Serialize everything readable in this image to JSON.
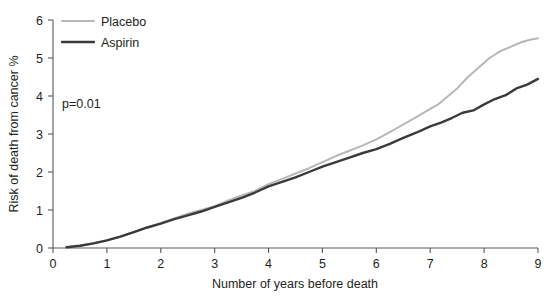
{
  "chart_data": {
    "type": "line",
    "title": "",
    "xlabel": "Number of years before death",
    "ylabel": "Risk of death from cancer %",
    "xlim": [
      0,
      9
    ],
    "ylim": [
      0,
      6
    ],
    "xticks": [
      0,
      1,
      2,
      3,
      4,
      5,
      6,
      7,
      8,
      9
    ],
    "yticks": [
      0,
      1,
      2,
      3,
      4,
      5,
      6
    ],
    "grid": false,
    "legend_position": "top-left",
    "annotations": [
      {
        "text": "p=0.01",
        "x": 1.0,
        "y": 4.0
      }
    ],
    "series": [
      {
        "name": "Placebo",
        "color": "#b7b7b7",
        "line_width": 2.0,
        "x": [
          0.25,
          0.5,
          0.75,
          1.0,
          1.25,
          1.5,
          1.75,
          2.0,
          2.25,
          2.5,
          2.75,
          3.0,
          3.25,
          3.5,
          3.75,
          4.0,
          4.25,
          4.5,
          4.75,
          5.0,
          5.25,
          5.5,
          5.75,
          6.0,
          6.25,
          6.5,
          6.75,
          7.0,
          7.15,
          7.3,
          7.5,
          7.7,
          7.9,
          8.1,
          8.3,
          8.5,
          8.7,
          8.85,
          9.0
        ],
        "y": [
          0.02,
          0.06,
          0.12,
          0.2,
          0.3,
          0.42,
          0.54,
          0.66,
          0.78,
          0.9,
          1.0,
          1.1,
          1.25,
          1.38,
          1.5,
          1.68,
          1.82,
          1.96,
          2.1,
          2.26,
          2.42,
          2.56,
          2.7,
          2.86,
          3.05,
          3.25,
          3.45,
          3.66,
          3.78,
          3.96,
          4.2,
          4.5,
          4.75,
          5.0,
          5.18,
          5.3,
          5.42,
          5.48,
          5.52
        ]
      },
      {
        "name": "Aspirin",
        "color": "#3a3a3c",
        "line_width": 2.4,
        "x": [
          0.25,
          0.5,
          0.75,
          1.0,
          1.25,
          1.5,
          1.75,
          2.0,
          2.25,
          2.5,
          2.75,
          3.0,
          3.25,
          3.5,
          3.75,
          4.0,
          4.25,
          4.5,
          4.75,
          5.0,
          5.25,
          5.5,
          5.75,
          6.0,
          6.25,
          6.5,
          6.75,
          7.0,
          7.2,
          7.4,
          7.6,
          7.8,
          8.0,
          8.2,
          8.4,
          8.6,
          8.8,
          9.0
        ],
        "y": [
          0.02,
          0.06,
          0.12,
          0.2,
          0.3,
          0.42,
          0.54,
          0.64,
          0.76,
          0.86,
          0.96,
          1.08,
          1.2,
          1.32,
          1.46,
          1.62,
          1.74,
          1.86,
          2.0,
          2.14,
          2.26,
          2.38,
          2.5,
          2.6,
          2.74,
          2.9,
          3.04,
          3.2,
          3.3,
          3.42,
          3.56,
          3.62,
          3.78,
          3.92,
          4.02,
          4.2,
          4.3,
          4.45
        ]
      }
    ]
  },
  "legend": {
    "items": [
      {
        "label": "Placebo",
        "color": "#b7b7b7"
      },
      {
        "label": "Aspirin",
        "color": "#3a3a3c"
      }
    ]
  },
  "axes": {
    "x_title": "Number of years before death",
    "y_title": "Risk of death from cancer %",
    "x_tick_labels": [
      "0",
      "1",
      "2",
      "3",
      "4",
      "5",
      "6",
      "7",
      "8",
      "9"
    ],
    "y_tick_labels": [
      "0",
      "1",
      "2",
      "3",
      "4",
      "5",
      "6"
    ]
  },
  "annotation": {
    "p_value": "p=0.01"
  }
}
